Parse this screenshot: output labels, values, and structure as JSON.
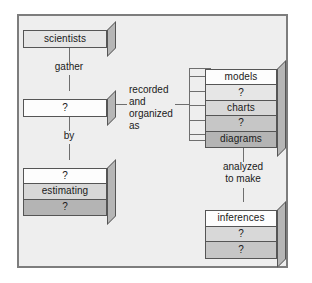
{
  "diagram": {
    "panel": {
      "background": "#eeeeee",
      "border_color": "#7d7d7d"
    },
    "nodes": {
      "scientists": {
        "layers": [
          {
            "text": "scientists",
            "tone": "t1"
          }
        ]
      },
      "data": {
        "layers": [
          {
            "text": "?",
            "tone": "t0"
          }
        ]
      },
      "methods": {
        "layers": [
          {
            "text": "?",
            "tone": "t0"
          },
          {
            "text": "estimating",
            "tone": "t2"
          },
          {
            "text": "?",
            "tone": "t4"
          }
        ]
      },
      "representations": {
        "layers": [
          {
            "text": "models",
            "tone": "t0"
          },
          {
            "text": "?",
            "tone": "t1"
          },
          {
            "text": "charts",
            "tone": "t2"
          },
          {
            "text": "?",
            "tone": "t3"
          },
          {
            "text": "diagrams",
            "tone": "t4"
          }
        ]
      },
      "inferences": {
        "layers": [
          {
            "text": "inferences",
            "tone": "t0"
          },
          {
            "text": "?",
            "tone": "t2"
          },
          {
            "text": "?",
            "tone": "t3"
          }
        ]
      }
    },
    "connectors": {
      "gather": "gather",
      "by": "by",
      "recorded_and_organized_as": "recorded\nand\norganized\nas",
      "analyzed_to_make": "analyzed\nto make"
    }
  }
}
